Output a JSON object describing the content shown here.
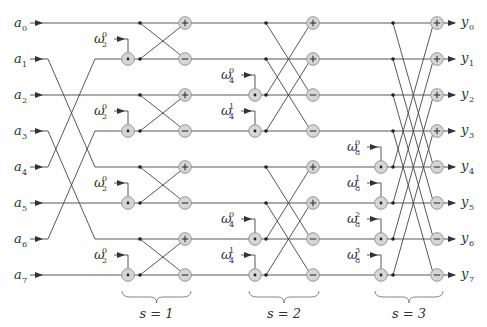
{
  "diagram": {
    "inputs": [
      {
        "sym": "a",
        "sub": "0"
      },
      {
        "sym": "a",
        "sub": "1"
      },
      {
        "sym": "a",
        "sub": "2"
      },
      {
        "sym": "a",
        "sub": "3"
      },
      {
        "sym": "a",
        "sub": "4"
      },
      {
        "sym": "a",
        "sub": "5"
      },
      {
        "sym": "a",
        "sub": "6"
      },
      {
        "sym": "a",
        "sub": "7"
      }
    ],
    "outputs": [
      {
        "sym": "y",
        "sub": "0"
      },
      {
        "sym": "y",
        "sub": "1"
      },
      {
        "sym": "y",
        "sub": "2"
      },
      {
        "sym": "y",
        "sub": "3"
      },
      {
        "sym": "y",
        "sub": "4"
      },
      {
        "sym": "y",
        "sub": "5"
      },
      {
        "sym": "y",
        "sub": "6"
      },
      {
        "sym": "y",
        "sub": "7"
      }
    ],
    "bit_reversal_order": [
      0,
      4,
      2,
      6,
      1,
      5,
      3,
      7
    ],
    "stages": [
      {
        "label": "s = 1",
        "twiddles": [
          {
            "row": 1,
            "sym": "ω",
            "sub": "2",
            "sup": "0"
          },
          {
            "row": 3,
            "sym": "ω",
            "sub": "2",
            "sup": "0"
          },
          {
            "row": 5,
            "sym": "ω",
            "sub": "2",
            "sup": "0"
          },
          {
            "row": 7,
            "sym": "ω",
            "sub": "2",
            "sup": "0"
          }
        ],
        "ops": [
          "+",
          "−",
          "+",
          "−",
          "+",
          "−",
          "+",
          "−"
        ]
      },
      {
        "label": "s = 2",
        "twiddles": [
          {
            "row": 2,
            "sym": "ω",
            "sub": "4",
            "sup": "0"
          },
          {
            "row": 3,
            "sym": "ω",
            "sub": "4",
            "sup": "1"
          },
          {
            "row": 6,
            "sym": "ω",
            "sub": "4",
            "sup": "0"
          },
          {
            "row": 7,
            "sym": "ω",
            "sub": "4",
            "sup": "1"
          }
        ],
        "ops": [
          "+",
          "+",
          "−",
          "−",
          "+",
          "+",
          "−",
          "−"
        ]
      },
      {
        "label": "s = 3",
        "twiddles": [
          {
            "row": 4,
            "sym": "ω",
            "sub": "8",
            "sup": "0"
          },
          {
            "row": 5,
            "sym": "ω",
            "sub": "8",
            "sup": "1"
          },
          {
            "row": 6,
            "sym": "ω",
            "sub": "8",
            "sup": "2"
          },
          {
            "row": 7,
            "sym": "ω",
            "sub": "8",
            "sup": "3"
          }
        ],
        "ops": [
          "+",
          "+",
          "+",
          "+",
          "−",
          "−",
          "−",
          "−"
        ]
      }
    ],
    "colors": {
      "line": "#444444",
      "node_fill": "#d6d6d6",
      "node_stroke": "#8a8a8a",
      "text": "#333333"
    }
  }
}
